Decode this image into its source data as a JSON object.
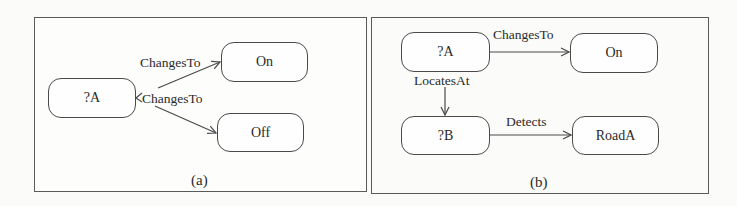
{
  "panels": [
    {
      "caption": "(a)",
      "nodes": [
        {
          "id": "A",
          "label": "?A"
        },
        {
          "id": "On",
          "label": "On"
        },
        {
          "id": "Off",
          "label": "Off"
        }
      ],
      "edges": [
        {
          "from": "A",
          "to": "On",
          "label": "ChangesTo"
        },
        {
          "from": "A",
          "to": "Off",
          "label": "ChangesTo"
        }
      ]
    },
    {
      "caption": "(b)",
      "nodes": [
        {
          "id": "A",
          "label": "?A"
        },
        {
          "id": "On",
          "label": "On"
        },
        {
          "id": "B",
          "label": "?B"
        },
        {
          "id": "RoadA",
          "label": "RoadA"
        }
      ],
      "edges": [
        {
          "from": "A",
          "to": "On",
          "label": "ChangesTo"
        },
        {
          "from": "A",
          "to": "B",
          "label": "LocatesAt"
        },
        {
          "from": "B",
          "to": "RoadA",
          "label": "Detects"
        }
      ]
    }
  ],
  "colors": {
    "stroke": "#4a4a4a",
    "frame": "#5a5a5a",
    "background": "#fbfbf9"
  }
}
